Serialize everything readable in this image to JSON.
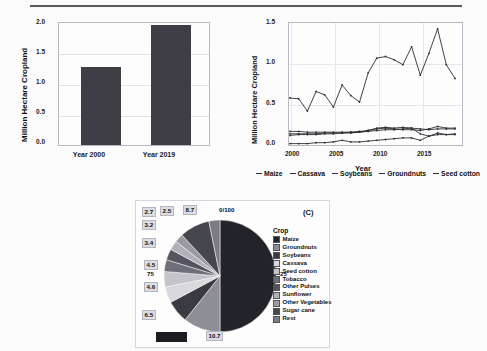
{
  "figure": {
    "panel_a_tag": "(A)",
    "panel_b_tag": "(B)",
    "panel_c_tag": "(C)"
  },
  "chart_data": [
    {
      "type": "bar",
      "panel": "A",
      "title": "",
      "xlabel": "",
      "ylabel": "Million Hectare Cropland",
      "categories": [
        "Year 2000",
        "Year 2019"
      ],
      "values": [
        1.28,
        1.96
      ],
      "ylim": [
        0.0,
        2.0
      ],
      "yticks": [
        "0.0",
        "0.5",
        "1.0",
        "1.5",
        "2.0"
      ],
      "grid": true,
      "legend": "none",
      "bar_color": "#3e3e44"
    },
    {
      "type": "line",
      "panel": "B",
      "title": "",
      "xlabel": "Year",
      "ylabel": "Million Hectare Cropland",
      "ylim": [
        0.0,
        1.5
      ],
      "xlim": [
        2000,
        2019
      ],
      "yticks": [
        "0.0",
        "0.5",
        "1.0",
        "1.5"
      ],
      "xticks": [
        "2000",
        "2005",
        "2010",
        "2015"
      ],
      "grid": true,
      "legend": "bottom",
      "x": [
        2000,
        2001,
        2002,
        2003,
        2004,
        2005,
        2006,
        2007,
        2008,
        2009,
        2010,
        2011,
        2012,
        2013,
        2014,
        2015,
        2016,
        2017,
        2018,
        2019
      ],
      "series": [
        {
          "name": "Maize",
          "values": [
            0.59,
            0.58,
            0.43,
            0.67,
            0.63,
            0.48,
            0.75,
            0.62,
            0.54,
            0.9,
            1.08,
            1.1,
            1.06,
            1.0,
            1.22,
            0.87,
            1.14,
            1.44,
            1.0,
            0.83
          ]
        },
        {
          "name": "Cassava",
          "values": [
            0.18,
            0.18,
            0.17,
            0.17,
            0.17,
            0.17,
            0.17,
            0.17,
            0.17,
            0.18,
            0.19,
            0.2,
            0.2,
            0.21,
            0.22,
            0.21,
            0.2,
            0.21,
            0.21,
            0.21
          ]
        },
        {
          "name": "Soybeans",
          "values": [
            0.03,
            0.03,
            0.03,
            0.04,
            0.04,
            0.05,
            0.07,
            0.05,
            0.05,
            0.06,
            0.07,
            0.08,
            0.09,
            0.1,
            0.1,
            0.07,
            0.12,
            0.16,
            0.14,
            0.14
          ]
        },
        {
          "name": "Groundnuts",
          "values": [
            0.13,
            0.14,
            0.14,
            0.14,
            0.15,
            0.15,
            0.16,
            0.16,
            0.17,
            0.19,
            0.21,
            0.22,
            0.21,
            0.2,
            0.2,
            0.19,
            0.21,
            0.24,
            0.22,
            0.22
          ]
        },
        {
          "name": "Seed cotton",
          "values": [
            0.15,
            0.15,
            0.15,
            0.15,
            0.16,
            0.16,
            0.16,
            0.17,
            0.18,
            0.19,
            0.22,
            0.23,
            0.22,
            0.23,
            0.22,
            0.15,
            0.12,
            0.14,
            0.14,
            0.15
          ]
        }
      ]
    },
    {
      "type": "pie",
      "panel": "C",
      "title": "",
      "legend_title": "Crop",
      "legend": "right",
      "axis_labels": [
        "0/100",
        "25",
        "50",
        "75"
      ],
      "labels": [
        "Maize",
        "Groundnuts",
        "Soybeans",
        "Cassava",
        "Seed cotton",
        "Tobacco",
        "Other Pulses",
        "Sunflower",
        "Other Vegetables",
        "Sugar cane",
        "Rest"
      ],
      "values": [
        50.0,
        10.7,
        6.5,
        4.6,
        4.5,
        3.4,
        3.2,
        2.7,
        2.5,
        8.7,
        3.2
      ],
      "value_labels": [
        "50",
        "10.7",
        "6.5",
        "4.6",
        "4.5",
        "3.4",
        "3.2",
        "2.7",
        "2.5",
        "8.7",
        ""
      ],
      "colors": [
        "#23232a",
        "#8e8e97",
        "#3a3a43",
        "#d8d8dd",
        "#c4c4cb",
        "#6f6f79",
        "#55555f",
        "#b0b0b8",
        "#9a9aa3",
        "#46464f",
        "#7c7c86"
      ]
    }
  ],
  "panelB_legend": [
    {
      "label": "Maize"
    },
    {
      "label": "Cassava"
    },
    {
      "label": "Soybeans"
    },
    {
      "label": "Groundnuts"
    },
    {
      "label": "Seed cotton"
    }
  ],
  "panelA_ticks": [
    "0.0",
    "0.5",
    "1.0",
    "1.5",
    "2.0"
  ],
  "panelB_yticks": [
    "0.0",
    "0.5",
    "1.0",
    "1.5"
  ],
  "panelB_xticks": [
    "2000",
    "2005",
    "2010",
    "2015"
  ]
}
